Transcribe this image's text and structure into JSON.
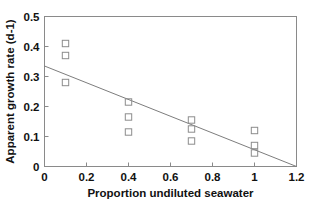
{
  "chart_data": {
    "type": "scatter",
    "title": "",
    "xlabel": "Proportion undiluted seawater",
    "ylabel": "Apparent growth rate (d-1)",
    "xlim": [
      0,
      1.2
    ],
    "ylim": [
      0,
      0.5
    ],
    "xticks": [
      0,
      0.2,
      0.4,
      0.6,
      0.8,
      1,
      1.2
    ],
    "xtick_labels": [
      "0",
      "0.2",
      "0.4",
      "0.6",
      "0.8",
      "1",
      "1.2"
    ],
    "yticks": [
      0,
      0.1,
      0.2,
      0.3,
      0.4,
      0.5
    ],
    "ytick_labels": [
      "0",
      "0.1",
      "0.2",
      "0.3",
      "0.4",
      "0.5"
    ],
    "grid": false,
    "legend": false,
    "marker": "open-square",
    "marker_color": "#8c8c8c",
    "series": [
      {
        "name": "Apparent growth rate",
        "points": [
          {
            "x": 0.1,
            "y": 0.41
          },
          {
            "x": 0.1,
            "y": 0.37
          },
          {
            "x": 0.1,
            "y": 0.28
          },
          {
            "x": 0.4,
            "y": 0.215
          },
          {
            "x": 0.4,
            "y": 0.165
          },
          {
            "x": 0.4,
            "y": 0.115
          },
          {
            "x": 0.7,
            "y": 0.155
          },
          {
            "x": 0.7,
            "y": 0.125
          },
          {
            "x": 0.7,
            "y": 0.085
          },
          {
            "x": 1.0,
            "y": 0.12
          },
          {
            "x": 1.0,
            "y": 0.07
          },
          {
            "x": 1.0,
            "y": 0.045
          }
        ]
      }
    ],
    "fit_line": {
      "name": "linear regression",
      "x_start": 0,
      "y_start": 0.335,
      "x_end": 1.2,
      "y_end": 0.0,
      "color": "#7d7d7d"
    }
  }
}
